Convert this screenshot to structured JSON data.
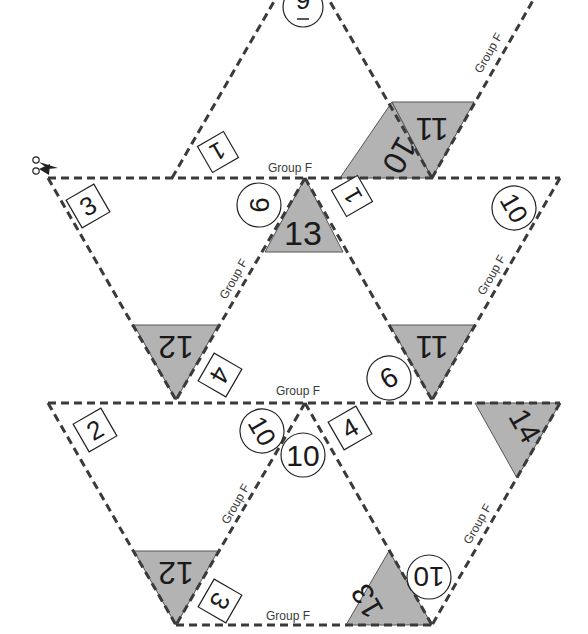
{
  "sheet": {
    "group_label": "Group F",
    "colors": {
      "shade": "#b3b3b3",
      "cut_line": "#3a3a3a",
      "background": "#ffffff"
    },
    "scissors_icon": "scissors-icon"
  },
  "labels": {
    "group_top": "Group F",
    "group_top_right_diag": "Group F",
    "group_mid_left_diag": "Group F",
    "group_mid_right_diag": "Group F",
    "group_mid": "Group F",
    "group_low_left_diag": "Group F",
    "group_low_right_diag": "Group F",
    "group_bottom": "Group F"
  },
  "shaded_numbers": {
    "top_10": "10",
    "top_11": "11",
    "mid_13": "13",
    "mid_12": "12",
    "mid_11": "11",
    "low_14": "14",
    "low_12": "12",
    "low_13": "13"
  },
  "boxed_numbers": {
    "top_1": "1",
    "mid_3": "3",
    "mid_1": "1",
    "mid_4": "4",
    "low_2": "2",
    "low_4": "4",
    "low_3": "3"
  },
  "circled_numbers": {
    "top_9": "9",
    "mid_6": "6",
    "mid_10": "10",
    "mid_9": "9",
    "low_10a": "10",
    "low_10b": "10",
    "low_10c": "10"
  }
}
